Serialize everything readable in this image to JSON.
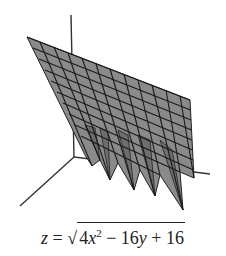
{
  "figure": {
    "type": "3d-surface-plot",
    "colors": {
      "surface": "#8a8a8a",
      "mesh": "#1a1a1a",
      "axes": "#333333",
      "background": "#ffffff"
    }
  },
  "caption": {
    "lhs": "z",
    "equals": "=",
    "sqrt_symbol": "√",
    "term1_coef": "4",
    "term1_var": "x",
    "term1_exp": "2",
    "op1": "−",
    "term2_coef": "16",
    "term2_var": "y",
    "op2": "+",
    "term3": "16"
  }
}
